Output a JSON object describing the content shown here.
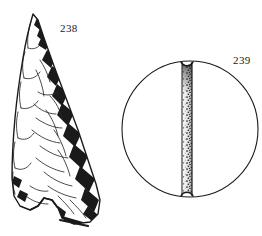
{
  "plate": {
    "kind": "archaeological-line-drawing",
    "background_color": "#ffffff",
    "ink_color": "#1a1a1a",
    "width": 262,
    "height": 236,
    "figures": [
      {
        "id": "238",
        "label": "238",
        "name": "projectile-point",
        "description": "Flaked stone projectile point, triangular blade with concave notched base, pressure flake scars along both edges, heavy shading on right margin",
        "label_position": {
          "x": 60,
          "y": 22
        }
      },
      {
        "id": "239",
        "label": "239",
        "name": "grooved-stone-disc",
        "description": "Circular stone disc in plan view with a broad vertical stippled band running top to bottom, notched where the band meets the upper and lower circumference",
        "label_position": {
          "x": 233,
          "y": 54
        }
      }
    ]
  }
}
